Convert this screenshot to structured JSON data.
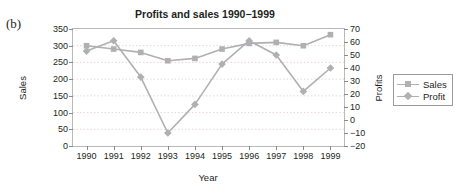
{
  "panel": {
    "label": "(b)"
  },
  "legend": {
    "position": "right",
    "entries": [
      {
        "label": "Sales",
        "marker": "square-marker"
      },
      {
        "label": "Profit",
        "marker": "diamond-marker"
      }
    ]
  },
  "colors": {
    "series": "#b0b0b2",
    "frame": "#b9b9bb",
    "grid": "#e9d7d9",
    "text": "#231f20"
  },
  "chart_data": {
    "type": "line",
    "title": "Profits and sales 1990−1999",
    "xlabel": "Year",
    "ylabel": "Sales",
    "y2label": "Profits",
    "categories": [
      "1990",
      "1991",
      "1992",
      "1993",
      "1994",
      "1995",
      "1996",
      "1997",
      "1998",
      "1999"
    ],
    "xticklabels": [
      "1990",
      "1991",
      "1992",
      "1993",
      "1994",
      "1995",
      "1996",
      "1997",
      "1998",
      "1999"
    ],
    "yticklabels": [
      "0",
      "50",
      "100",
      "150",
      "200",
      "250",
      "300",
      "350"
    ],
    "y2ticklabels": [
      "−20",
      "−10",
      "0",
      "10",
      "20",
      "30",
      "40",
      "50",
      "60",
      "70"
    ],
    "ylim": [
      0,
      350
    ],
    "y2lim": [
      -20,
      70
    ],
    "ytickvals": [
      0,
      50,
      100,
      150,
      200,
      250,
      300,
      350
    ],
    "y2tickvals": [
      -20,
      -10,
      0,
      10,
      20,
      30,
      40,
      50,
      60,
      70
    ],
    "grid": true,
    "series": [
      {
        "name": "Sales",
        "axis": "left",
        "marker": "square",
        "values": [
          300,
          290,
          280,
          255,
          262,
          290,
          307,
          310,
          300,
          333
        ]
      },
      {
        "name": "Profit",
        "axis": "right",
        "marker": "diamond",
        "values": [
          53,
          61,
          33,
          -10,
          12,
          43,
          61,
          50,
          22,
          40
        ]
      }
    ]
  }
}
